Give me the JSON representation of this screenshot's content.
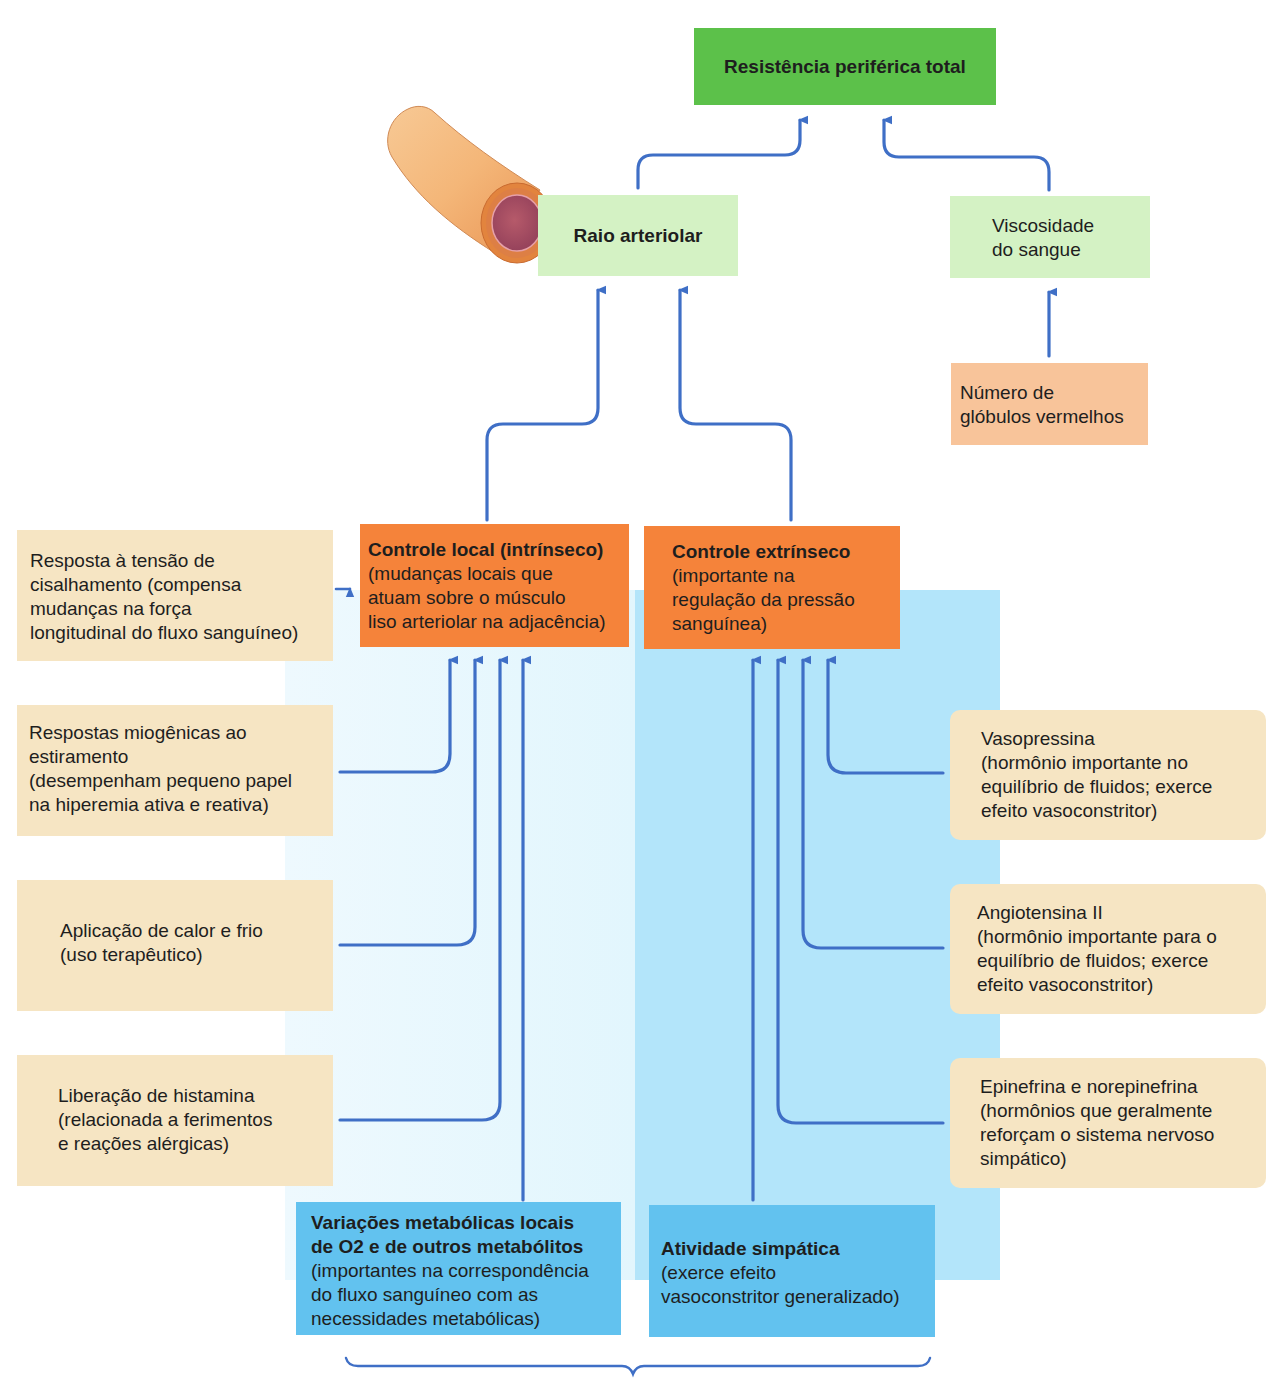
{
  "diagram": {
    "colors": {
      "top_box": "#5cc14a",
      "level2_box": "#d4f2c4",
      "rbc_box": "#f8c49a",
      "factor_box": "#f6e5c3",
      "control_box": "#f5833a",
      "source_box": "#62c2ef",
      "left_panel": "#e6f8fe",
      "right_panel": "#b3e5fa",
      "arrow": "#3f6fc6"
    },
    "top": {
      "label": "Resistência periférica total"
    },
    "raio": {
      "label": "Raio arteriolar",
      "illustration": "arteriole-cross-section-illustration"
    },
    "viscosidade": {
      "lines": [
        "Viscosidade",
        "do sangue"
      ]
    },
    "globulos": {
      "lines": [
        "Número de",
        "glóbulos vermelhos"
      ]
    },
    "controle_local": {
      "title": "Controle local (intrínseco)",
      "lines": [
        "(mudanças locais que",
        "atuam sobre o músculo",
        "liso arteriolar na adjacência)"
      ]
    },
    "controle_extrinseco": {
      "title": "Controle extrínseco",
      "lines": [
        "(importante na",
        "regulação da pressão",
        "sanguínea)"
      ]
    },
    "left_factors": [
      {
        "lines": [
          "Resposta à tensão de",
          "cisalhamento (compensa",
          "mudanças na força",
          "longitudinal do fluxo sanguíneo)"
        ]
      },
      {
        "lines": [
          "Respostas miogênicas ao",
          "estiramento",
          "(desempenham pequeno papel",
          "na hiperemia ativa e reativa)"
        ]
      },
      {
        "lines": [
          "Aplicação de calor e frio",
          "(uso terapêutico)"
        ]
      },
      {
        "lines": [
          "Liberação de histamina",
          "(relacionada a ferimentos",
          "e reações alérgicas)"
        ]
      }
    ],
    "right_factors": [
      {
        "lines": [
          "Vasopressina",
          "(hormônio importante no",
          "equilíbrio de fluidos; exerce",
          "efeito vasoconstritor)"
        ]
      },
      {
        "lines": [
          "Angiotensina II",
          "(hormônio importante para o",
          "equilíbrio de fluidos; exerce",
          "efeito vasoconstritor)"
        ]
      },
      {
        "lines": [
          "Epinefrina e norepinefrina",
          "(hormônios que geralmente",
          "reforçam o sistema nervoso",
          "simpático)"
        ]
      }
    ],
    "metabolic": {
      "title_lines": [
        "Variações metabólicas locais",
        "de O2 e de outros metabólitos"
      ],
      "lines": [
        "(importantes na correspondência",
        "do fluxo sanguíneo com as",
        "necessidades metabólicas)"
      ]
    },
    "sympathetic": {
      "title": "Atividade simpática",
      "lines": [
        "(exerce efeito",
        "vasoconstritor generalizado)"
      ]
    }
  }
}
